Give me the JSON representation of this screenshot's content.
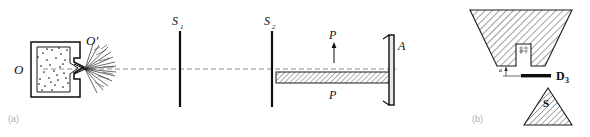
{
  "figure": {
    "kind": "molecular-beam-apparatus-schematic",
    "panels": [
      {
        "id": "a",
        "caption": "(a)",
        "labels": {
          "oven": "O",
          "nozzle": "O'",
          "slit_1": "S",
          "slit_1_sub": "1",
          "slit_2": "S",
          "slit_2_sub": "2",
          "plate_top": "P",
          "plate_bottom": "P",
          "detector": "A"
        }
      },
      {
        "id": "b",
        "caption": "(b)",
        "labels": {
          "slit_bar": "D",
          "slit_bar_sub": "3",
          "south_pole": "S",
          "gap_mark": "a",
          "notch_mark": "b"
        }
      }
    ],
    "colors": {
      "ink": "#0d0d0d",
      "hatch": "#2b2b2b",
      "axis_dash": "#8e8e8e",
      "caption": "#adadad",
      "background": "#ffffff"
    }
  }
}
